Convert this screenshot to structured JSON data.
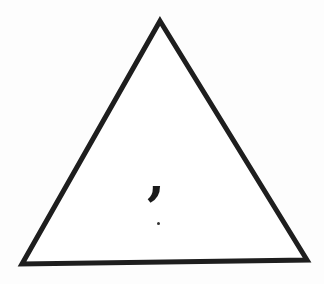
{
  "figure": {
    "shape": "triangle",
    "stroke_color": "#1e1e1e",
    "fill_color": "#ffffff",
    "inner_symbol": ",",
    "inner_symbol_name": "comma",
    "has_small_dot": true
  }
}
